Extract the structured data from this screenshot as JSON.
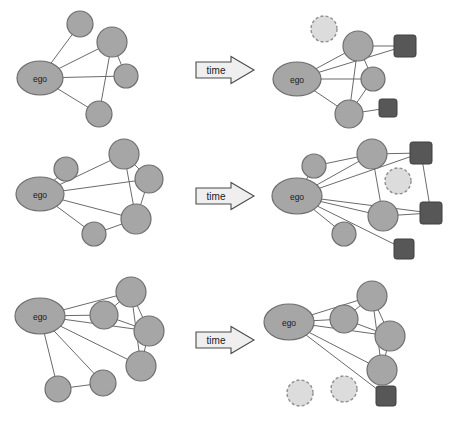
{
  "figure": {
    "type": "diagram",
    "width": 458,
    "height": 424,
    "background": "#ffffff"
  },
  "legend_colors": {
    "node_fill": "#a6a6a6",
    "node_stroke": "#6e6e6e",
    "edge": "#6b6b6b",
    "dashed_node_fill": "#dcdcdc",
    "dashed_node_stroke": "#8f8f8f",
    "square_fill": "#575757",
    "arrow_fill": "#efefef",
    "arrow_stroke": "#4a4a4a",
    "text": "#1a1a1a"
  },
  "arrows": [
    {
      "label": "time",
      "cx": 222,
      "cy": 70
    },
    {
      "label": "time",
      "cx": 222,
      "cy": 196
    },
    {
      "label": "time",
      "cx": 222,
      "cy": 340
    }
  ],
  "ego_label": "ego",
  "caption": "",
  "rows": [
    {
      "id": "row-1",
      "before": {
        "ego": {
          "cx": 40,
          "cy": 78,
          "rx": 23,
          "ry": 17,
          "label": "ego"
        },
        "nodes": [
          {
            "id": "a",
            "cx": 80,
            "cy": 24,
            "r": 13
          },
          {
            "id": "b",
            "cx": 112,
            "cy": 42,
            "r": 15
          },
          {
            "id": "c",
            "cx": 126,
            "cy": 76,
            "r": 12
          },
          {
            "id": "d",
            "cx": 99,
            "cy": 114,
            "r": 13
          }
        ],
        "dashed_nodes": [],
        "squares": [],
        "edges": [
          [
            "ego",
            "a"
          ],
          [
            "ego",
            "b"
          ],
          [
            "ego",
            "c"
          ],
          [
            "ego",
            "d"
          ],
          [
            "b",
            "c"
          ],
          [
            "b",
            "d"
          ]
        ]
      },
      "after": {
        "ego": {
          "cx": 297,
          "cy": 79,
          "rx": 24,
          "ry": 17,
          "label": "ego"
        },
        "nodes": [
          {
            "id": "b",
            "cx": 358,
            "cy": 46,
            "r": 15
          },
          {
            "id": "c",
            "cx": 373,
            "cy": 79,
            "r": 12
          },
          {
            "id": "d",
            "cx": 349,
            "cy": 114,
            "r": 14
          }
        ],
        "dashed_nodes": [
          {
            "id": "a",
            "cx": 324,
            "cy": 29,
            "r": 13
          }
        ],
        "squares": [
          {
            "id": "s1",
            "cx": 405,
            "cy": 46,
            "size": 22
          },
          {
            "id": "s2",
            "cx": 388,
            "cy": 108,
            "size": 18
          }
        ],
        "edges": [
          [
            "ego",
            "b"
          ],
          [
            "ego",
            "c"
          ],
          [
            "ego",
            "d"
          ],
          [
            "ego",
            "s1"
          ],
          [
            "b",
            "c"
          ],
          [
            "b",
            "d"
          ],
          [
            "b",
            "s1"
          ],
          [
            "c",
            "d"
          ],
          [
            "d",
            "s2"
          ]
        ]
      }
    },
    {
      "id": "row-2",
      "before": {
        "ego": {
          "cx": 40,
          "cy": 194,
          "rx": 24,
          "ry": 17,
          "label": "ego"
        },
        "nodes": [
          {
            "id": "a",
            "cx": 66,
            "cy": 169,
            "r": 12
          },
          {
            "id": "b",
            "cx": 124,
            "cy": 154,
            "r": 15
          },
          {
            "id": "c",
            "cx": 149,
            "cy": 179,
            "r": 14
          },
          {
            "id": "d",
            "cx": 136,
            "cy": 219,
            "r": 15
          },
          {
            "id": "e",
            "cx": 94,
            "cy": 234,
            "r": 12
          }
        ],
        "dashed_nodes": [],
        "squares": [],
        "edges": [
          [
            "ego",
            "a"
          ],
          [
            "ego",
            "b"
          ],
          [
            "ego",
            "c"
          ],
          [
            "ego",
            "d"
          ],
          [
            "ego",
            "e"
          ],
          [
            "b",
            "c"
          ],
          [
            "b",
            "d"
          ],
          [
            "c",
            "d"
          ],
          [
            "d",
            "e"
          ]
        ]
      },
      "after": {
        "ego": {
          "cx": 297,
          "cy": 196,
          "rx": 25,
          "ry": 18,
          "label": "ego"
        },
        "nodes": [
          {
            "id": "a",
            "cx": 314,
            "cy": 166,
            "r": 12
          },
          {
            "id": "b",
            "cx": 372,
            "cy": 154,
            "r": 15
          },
          {
            "id": "d",
            "cx": 383,
            "cy": 216,
            "r": 15
          },
          {
            "id": "e",
            "cx": 344,
            "cy": 234,
            "r": 12
          }
        ],
        "dashed_nodes": [
          {
            "id": "c",
            "cx": 398,
            "cy": 181,
            "r": 13
          }
        ],
        "squares": [
          {
            "id": "s1",
            "cx": 421,
            "cy": 153,
            "size": 22
          },
          {
            "id": "s2",
            "cx": 431,
            "cy": 213,
            "size": 22
          },
          {
            "id": "s3",
            "cx": 404,
            "cy": 249,
            "size": 20
          }
        ],
        "edges": [
          [
            "ego",
            "a"
          ],
          [
            "ego",
            "b"
          ],
          [
            "ego",
            "d"
          ],
          [
            "ego",
            "e"
          ],
          [
            "ego",
            "s1"
          ],
          [
            "ego",
            "s2"
          ],
          [
            "ego",
            "s3"
          ],
          [
            "a",
            "b"
          ],
          [
            "b",
            "d"
          ],
          [
            "b",
            "s1"
          ],
          [
            "d",
            "s2"
          ],
          [
            "s1",
            "s2"
          ]
        ]
      }
    },
    {
      "id": "row-3",
      "before": {
        "ego": {
          "cx": 40,
          "cy": 316,
          "rx": 25,
          "ry": 18,
          "label": "ego"
        },
        "nodes": [
          {
            "id": "a",
            "cx": 104,
            "cy": 315,
            "r": 14
          },
          {
            "id": "b",
            "cx": 131,
            "cy": 292,
            "r": 15
          },
          {
            "id": "c",
            "cx": 149,
            "cy": 331,
            "r": 15
          },
          {
            "id": "d",
            "cx": 141,
            "cy": 366,
            "r": 15
          },
          {
            "id": "e",
            "cx": 103,
            "cy": 383,
            "r": 13
          },
          {
            "id": "f",
            "cx": 58,
            "cy": 389,
            "r": 13
          }
        ],
        "dashed_nodes": [],
        "squares": [],
        "edges": [
          [
            "ego",
            "a"
          ],
          [
            "ego",
            "b"
          ],
          [
            "ego",
            "c"
          ],
          [
            "ego",
            "d"
          ],
          [
            "ego",
            "e"
          ],
          [
            "ego",
            "f"
          ],
          [
            "a",
            "b"
          ],
          [
            "a",
            "c"
          ],
          [
            "b",
            "c"
          ],
          [
            "b",
            "d"
          ],
          [
            "c",
            "d"
          ],
          [
            "e",
            "f"
          ]
        ]
      },
      "after": {
        "ego": {
          "cx": 289,
          "cy": 322,
          "rx": 25,
          "ry": 18,
          "label": "ego"
        },
        "nodes": [
          {
            "id": "a",
            "cx": 344,
            "cy": 319,
            "r": 14
          },
          {
            "id": "b",
            "cx": 372,
            "cy": 296,
            "r": 15
          },
          {
            "id": "c",
            "cx": 390,
            "cy": 336,
            "r": 15
          },
          {
            "id": "d",
            "cx": 382,
            "cy": 370,
            "r": 15
          }
        ],
        "dashed_nodes": [
          {
            "id": "e",
            "cx": 344,
            "cy": 389,
            "r": 13
          },
          {
            "id": "f",
            "cx": 300,
            "cy": 393,
            "r": 13
          }
        ],
        "squares": [
          {
            "id": "s1",
            "cx": 386,
            "cy": 396,
            "size": 20
          }
        ],
        "edges": [
          [
            "ego",
            "a"
          ],
          [
            "ego",
            "b"
          ],
          [
            "ego",
            "c"
          ],
          [
            "ego",
            "d"
          ],
          [
            "ego",
            "s1"
          ],
          [
            "a",
            "b"
          ],
          [
            "a",
            "c"
          ],
          [
            "b",
            "c"
          ],
          [
            "b",
            "d"
          ],
          [
            "c",
            "d"
          ]
        ]
      }
    }
  ]
}
